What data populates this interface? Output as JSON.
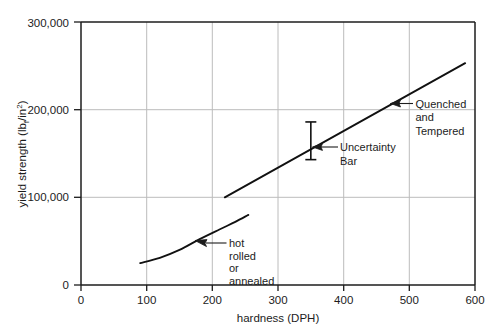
{
  "chart_data": {
    "type": "line",
    "title": "",
    "xlabel": "hardness (DPH)",
    "ylabel": "yield strength (lb_f/in²)",
    "ylabel_parts": {
      "main": "yield strength (lb",
      "sub": "f",
      "mid": "/in",
      "sup": "2",
      "close": ")"
    },
    "xlim": [
      0,
      600
    ],
    "ylim": [
      0,
      300000
    ],
    "grid": true,
    "grid_x": [
      100,
      200,
      300,
      400,
      500
    ],
    "grid_y": [
      100000,
      200000
    ],
    "xticks": [
      0,
      100,
      200,
      300,
      400,
      500,
      600
    ],
    "xtick_labels": [
      "0",
      "100",
      "200",
      "300",
      "400",
      "500",
      "600"
    ],
    "yticks": [
      0,
      100000,
      200000,
      300000
    ],
    "ytick_labels": [
      "0",
      "100,000",
      "200,000",
      "300,000"
    ],
    "series": [
      {
        "name": "hot rolled or annealed",
        "style": "curve",
        "points": [
          [
            90,
            25000
          ],
          [
            120,
            31000
          ],
          [
            150,
            40000
          ],
          [
            180,
            52000
          ],
          [
            210,
            63000
          ],
          [
            235,
            72000
          ],
          [
            255,
            80000
          ]
        ]
      },
      {
        "name": "Quenched and Tempered",
        "style": "straight",
        "points": [
          [
            219,
            100000
          ],
          [
            585,
            253000
          ]
        ]
      }
    ],
    "error_bars": [
      {
        "name": "Uncertainty Bar",
        "x": 350,
        "y": 164000,
        "ymin": 143000,
        "ymax": 186000
      }
    ],
    "annotations": [
      {
        "id": "quenched-and-tempered",
        "lines": [
          "Quenched",
          "and",
          "Tempered"
        ],
        "target_x": 455,
        "target_y": 193000,
        "text_x": 418,
        "text_y": 196000
      },
      {
        "id": "hot-rolled-or-annealed",
        "lines": [
          "hot",
          "rolled",
          "or",
          "annealed"
        ],
        "target_x": 228,
        "target_y": 66000,
        "text_x": 267,
        "text_y": 66000
      },
      {
        "id": "uncertainty-bar",
        "lines": [
          "Uncertainty",
          "Bar"
        ],
        "target_x": 355,
        "target_y": 164000,
        "text_x": 378,
        "text_y": 164000
      }
    ],
    "colors": {
      "background": "#ffffff",
      "axis": "#1c1c1c",
      "grid": "#b9b9b9",
      "data": "#111111",
      "text": "#1c1c1c"
    }
  }
}
